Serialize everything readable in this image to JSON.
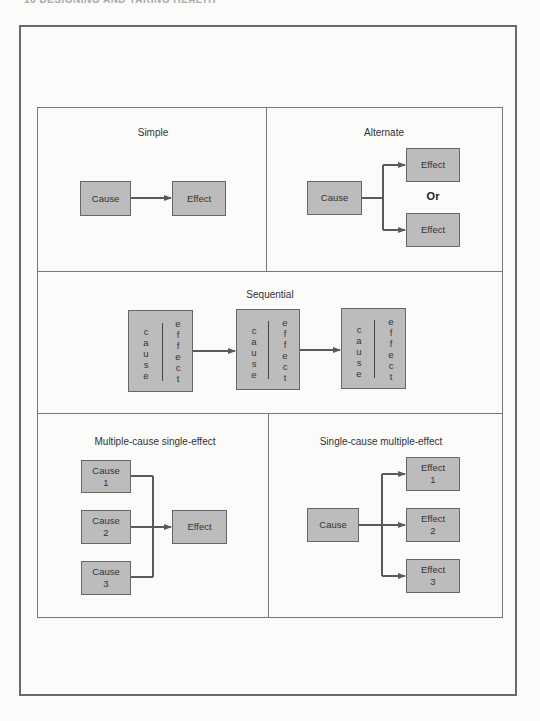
{
  "page_header": "16      DESIGNING AND TAKING HEALTH",
  "panels": {
    "simple": {
      "title": "Simple",
      "cause": "Cause",
      "effect": "Effect"
    },
    "alternate": {
      "title": "Alternate",
      "cause": "Cause",
      "effect_top": "Effect",
      "or_label": "Or",
      "effect_bottom": "Effect"
    },
    "sequential": {
      "title": "Sequential",
      "boxes": [
        {
          "cause": "c\na\nu\ns\ne",
          "effect": "e\nf\nf\ne\nc\nt"
        },
        {
          "cause": "c\na\nu\ns\ne",
          "effect": "e\nf\nf\ne\nc\nt"
        },
        {
          "cause": "c\na\nu\ns\ne",
          "effect": "e\nf\nf\ne\nc\nt"
        }
      ]
    },
    "multiple_cause": {
      "title": "Multiple-cause single-effect",
      "causes": [
        "Cause\n1",
        "Cause\n2",
        "Cause\n3"
      ],
      "effect": "Effect"
    },
    "single_cause": {
      "title": "Single-cause multiple-effect",
      "cause": "Cause",
      "effects": [
        "Effect\n1",
        "Effect\n2",
        "Effect\n3"
      ]
    }
  },
  "colors": {
    "box_fill": "#bcbcbc",
    "box_border": "#666666",
    "connector": "#5a5a5a",
    "frame": "#777777"
  }
}
